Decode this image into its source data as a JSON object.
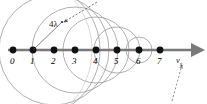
{
  "figure": {
    "axis": {
      "name": "source-travel-axis",
      "color": "#7a7a7a",
      "y": 50,
      "x_start": 8,
      "x_end": 200,
      "arrow": "right"
    },
    "velocity_label": {
      "text": "v",
      "subscript": "s",
      "x": 176,
      "y": 56
    },
    "wavelength_label": {
      "text": "4λ",
      "x": 49,
      "y": 20
    },
    "source_positions": [
      {
        "label": "0",
        "x": 13,
        "radius": 79,
        "label_x": 10,
        "label_y": 57
      },
      {
        "label": "1",
        "x": 33,
        "radius": 67,
        "label_x": 30,
        "label_y": 57
      },
      {
        "label": "2",
        "x": 54,
        "radius": 55,
        "label_x": 51,
        "label_y": 57
      },
      {
        "label": "3",
        "x": 75,
        "radius": 43,
        "label_x": 72,
        "label_y": 57
      },
      {
        "label": "4",
        "x": 96,
        "radius": 33,
        "label_x": 93,
        "label_y": 57
      },
      {
        "label": "5",
        "x": 117,
        "radius": 23,
        "label_x": 114,
        "label_y": 57
      },
      {
        "label": "6",
        "x": 139,
        "radius": 13,
        "label_x": 136,
        "label_y": 57
      },
      {
        "label": "7",
        "x": 160,
        "radius": 0,
        "label_x": 157,
        "label_y": 57
      }
    ],
    "radius_pointer": {
      "name": "radius-line",
      "from_x": 33,
      "from_y": 50,
      "to_x": 62,
      "to_y": 22
    },
    "dashed_leader_top": {
      "name": "wavelength-leader",
      "from_x": 97,
      "from_y": 2,
      "to_x": 63,
      "to_y": 22
    },
    "dashed_leader_bottom": {
      "name": "velocity-leader",
      "from_x": 172,
      "from_y": 101,
      "to_x": 182,
      "to_y": 64
    },
    "colors": {
      "dot": "#111111",
      "axis": "#7a7a7a",
      "wavefront": "#9a9a9a",
      "wavefront_faint": "#c8c8c8",
      "leader": "#555555",
      "background": "#ffffff"
    }
  }
}
